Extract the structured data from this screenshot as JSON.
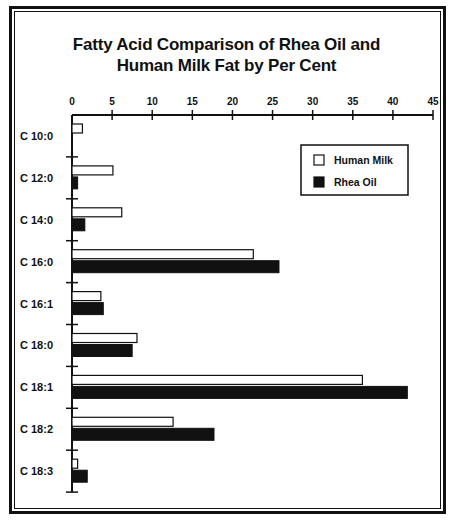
{
  "chart_data": {
    "type": "bar",
    "orientation": "horizontal",
    "title": "Fatty Acid Comparison of Rhea Oil and Human Milk Fat by Per Cent",
    "title_lines": [
      "Fatty Acid Comparison of Rhea Oil and",
      "Human Milk Fat by Per Cent"
    ],
    "xlabel": "",
    "ylabel": "",
    "xlim": [
      0,
      45
    ],
    "x_ticks": [
      0,
      5,
      10,
      15,
      20,
      25,
      30,
      35,
      40,
      45
    ],
    "x_axis_position": "top",
    "grid": false,
    "categories": [
      "C 10:0",
      "C 12:0",
      "C 14:0",
      "C 16:0",
      "C 16:1",
      "C 18:0",
      "C 18:1",
      "C 18:2",
      "C 18:3"
    ],
    "series": [
      {
        "name": "Human Milk",
        "fill": "#ffffff",
        "stroke": "#111111",
        "values": [
          1.3,
          5.1,
          6.2,
          22.6,
          3.6,
          8.1,
          36.2,
          12.6,
          0.7
        ]
      },
      {
        "name": "Rhea Oil",
        "fill": "#111111",
        "stroke": "#111111",
        "values": [
          0,
          0.7,
          1.6,
          25.8,
          3.9,
          7.5,
          41.8,
          17.7,
          1.9
        ]
      }
    ],
    "legend": {
      "position": "upper-right",
      "entries": [
        "Human Milk",
        "Rhea Oil"
      ]
    }
  }
}
